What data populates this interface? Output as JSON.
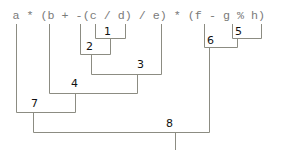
{
  "diagram": {
    "type": "expression-parse-tree",
    "expression": "a * (b + -(c / d) / e) * (f - g % h)",
    "tokens": [
      "a",
      "*",
      "(",
      "b",
      "+",
      "-",
      "(",
      "c",
      "/",
      "d",
      ")",
      "/",
      "e",
      ")",
      "*",
      "(",
      "f",
      "-",
      "g",
      "%",
      "h",
      ")"
    ],
    "nodes": [
      {
        "label": "1",
        "operation": "c / d",
        "children": [
          "c",
          "d"
        ]
      },
      {
        "label": "2",
        "operation": "-(c / d)",
        "children": [
          "-",
          "1"
        ]
      },
      {
        "label": "3",
        "operation": "-(c / d) / e",
        "children": [
          "2",
          "e"
        ]
      },
      {
        "label": "4",
        "operation": "b + -(c / d) / e",
        "children": [
          "b",
          "3"
        ]
      },
      {
        "label": "5",
        "operation": "g % h",
        "children": [
          "g",
          "h"
        ]
      },
      {
        "label": "6",
        "operation": "f - g % h",
        "children": [
          "f",
          "5"
        ]
      },
      {
        "label": "7",
        "operation": "a * (b + -(c / d) / e)",
        "children": [
          "a",
          "4"
        ]
      },
      {
        "label": "8",
        "operation": "a * (b + -(c / d) / e) * (f - g % h)",
        "children": [
          "7",
          "6"
        ]
      }
    ]
  }
}
